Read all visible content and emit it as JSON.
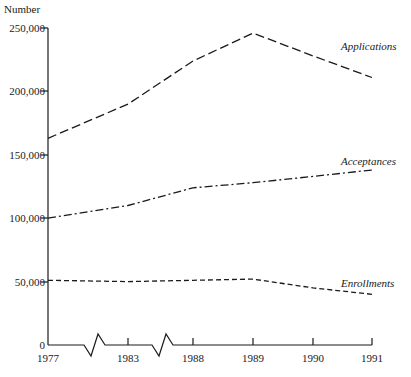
{
  "chart_data": {
    "type": "line",
    "title": "",
    "xlabel": "",
    "ylabel": "Number",
    "categories": [
      "1977",
      "1983",
      "1988",
      "1989",
      "1990",
      "1991"
    ],
    "x": [
      1977,
      1983,
      1988,
      1989,
      1990,
      1991
    ],
    "ylim": [
      0,
      250000
    ],
    "yticks": [
      0,
      50000,
      100000,
      150000,
      200000,
      250000
    ],
    "ytick_labels": [
      "0",
      "50,000",
      "100,000",
      "150,000",
      "200,000",
      "250,000"
    ],
    "xtick_labels": [
      "1977",
      "1983",
      "1988",
      "1989",
      "1990",
      "1991"
    ],
    "grid": false,
    "legend_position": "inline-right",
    "axis_breaks": [
      "between 1977 and 1983",
      "between 1983 and 1988"
    ],
    "series": [
      {
        "name": "Applications",
        "line_style": "long-dash",
        "color": "#1a1a1a",
        "values": [
          163000,
          190000,
          224000,
          246000,
          228000,
          211000
        ]
      },
      {
        "name": "Acceptances",
        "line_style": "dash-dot",
        "color": "#1a1a1a",
        "values": [
          100000,
          110000,
          124000,
          128000,
          133000,
          138000
        ]
      },
      {
        "name": "Enrollments",
        "line_style": "short-dash",
        "color": "#1a1a1a",
        "values": [
          51000,
          50000,
          51000,
          52000,
          45000,
          40000
        ]
      }
    ]
  },
  "axis": {
    "unit_label": "Number"
  },
  "labels": {
    "applications": "Applications",
    "acceptances": "Acceptances",
    "enrollments": "Enrollments"
  },
  "yticks": {
    "t0": "0",
    "t1": "50,000",
    "t2": "100,000",
    "t3": "150,000",
    "t4": "200,000",
    "t5": "250,000"
  },
  "xticks": {
    "x0": "1977",
    "x1": "1983",
    "x2": "1988",
    "x3": "1989",
    "x4": "1990",
    "x5": "1991"
  }
}
